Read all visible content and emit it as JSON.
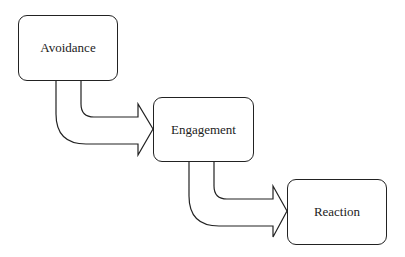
{
  "diagram": {
    "type": "flow",
    "stroke_color": "#222222",
    "background": "#ffffff",
    "nodes": [
      {
        "id": "avoidance",
        "label": "Avoidance"
      },
      {
        "id": "engagement",
        "label": "Engagement"
      },
      {
        "id": "reaction",
        "label": "Reaction"
      }
    ],
    "edges": [
      {
        "from": "avoidance",
        "to": "engagement",
        "style": "bent-block-arrow"
      },
      {
        "from": "engagement",
        "to": "reaction",
        "style": "bent-block-arrow"
      }
    ]
  }
}
